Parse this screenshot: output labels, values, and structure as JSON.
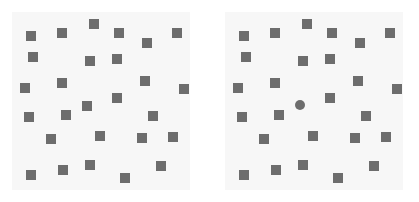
{
  "figure": {
    "name": "visual-search-stimulus",
    "width": 419,
    "height": 202,
    "page_background": "#ffffff",
    "panel_background": "#f7f7f7",
    "item_color": "#6d6d6d",
    "item_size_px": 10
  },
  "panels": [
    {
      "id": "panel-left",
      "label": "left-panel",
      "x": 12,
      "y": 12,
      "width": 178,
      "height": 178,
      "square_count": 27,
      "circle_count": 0,
      "has_target": false,
      "items": [
        {
          "shape": "square",
          "x": 31,
          "y": 36
        },
        {
          "shape": "square",
          "x": 62,
          "y": 33
        },
        {
          "shape": "square",
          "x": 94,
          "y": 24
        },
        {
          "shape": "square",
          "x": 119,
          "y": 33
        },
        {
          "shape": "square",
          "x": 147,
          "y": 43
        },
        {
          "shape": "square",
          "x": 177,
          "y": 33
        },
        {
          "shape": "square",
          "x": 33,
          "y": 57
        },
        {
          "shape": "square",
          "x": 90,
          "y": 61
        },
        {
          "shape": "square",
          "x": 117,
          "y": 59
        },
        {
          "shape": "square",
          "x": 25,
          "y": 88
        },
        {
          "shape": "square",
          "x": 62,
          "y": 83
        },
        {
          "shape": "square",
          "x": 145,
          "y": 81
        },
        {
          "shape": "square",
          "x": 184,
          "y": 89
        },
        {
          "shape": "square",
          "x": 117,
          "y": 98
        },
        {
          "shape": "square",
          "x": 87,
          "y": 106
        },
        {
          "shape": "square",
          "x": 29,
          "y": 117
        },
        {
          "shape": "square",
          "x": 66,
          "y": 115
        },
        {
          "shape": "square",
          "x": 153,
          "y": 116
        },
        {
          "shape": "square",
          "x": 51,
          "y": 139
        },
        {
          "shape": "square",
          "x": 100,
          "y": 136
        },
        {
          "shape": "square",
          "x": 142,
          "y": 138
        },
        {
          "shape": "square",
          "x": 173,
          "y": 137
        },
        {
          "shape": "square",
          "x": 63,
          "y": 170
        },
        {
          "shape": "square",
          "x": 90,
          "y": 165
        },
        {
          "shape": "square",
          "x": 125,
          "y": 178
        },
        {
          "shape": "square",
          "x": 161,
          "y": 166
        },
        {
          "shape": "square",
          "x": 31,
          "y": 175
        }
      ]
    },
    {
      "id": "panel-right",
      "label": "right-panel",
      "x": 225,
      "y": 12,
      "width": 178,
      "height": 178,
      "square_count": 26,
      "circle_count": 1,
      "has_target": true,
      "target_shape": "circle",
      "target_x": 300,
      "target_y": 105,
      "items": [
        {
          "shape": "square",
          "x": 244,
          "y": 36
        },
        {
          "shape": "square",
          "x": 275,
          "y": 33
        },
        {
          "shape": "square",
          "x": 307,
          "y": 24
        },
        {
          "shape": "square",
          "x": 332,
          "y": 33
        },
        {
          "shape": "square",
          "x": 360,
          "y": 43
        },
        {
          "shape": "square",
          "x": 390,
          "y": 33
        },
        {
          "shape": "square",
          "x": 246,
          "y": 57
        },
        {
          "shape": "square",
          "x": 303,
          "y": 61
        },
        {
          "shape": "square",
          "x": 330,
          "y": 59
        },
        {
          "shape": "square",
          "x": 238,
          "y": 88
        },
        {
          "shape": "square",
          "x": 275,
          "y": 83
        },
        {
          "shape": "square",
          "x": 358,
          "y": 81
        },
        {
          "shape": "square",
          "x": 397,
          "y": 89
        },
        {
          "shape": "square",
          "x": 330,
          "y": 98
        },
        {
          "shape": "circle",
          "x": 300,
          "y": 105
        },
        {
          "shape": "square",
          "x": 242,
          "y": 117
        },
        {
          "shape": "square",
          "x": 279,
          "y": 115
        },
        {
          "shape": "square",
          "x": 366,
          "y": 116
        },
        {
          "shape": "square",
          "x": 264,
          "y": 139
        },
        {
          "shape": "square",
          "x": 313,
          "y": 136
        },
        {
          "shape": "square",
          "x": 355,
          "y": 138
        },
        {
          "shape": "square",
          "x": 386,
          "y": 137
        },
        {
          "shape": "square",
          "x": 276,
          "y": 170
        },
        {
          "shape": "square",
          "x": 303,
          "y": 165
        },
        {
          "shape": "square",
          "x": 338,
          "y": 178
        },
        {
          "shape": "square",
          "x": 374,
          "y": 166
        },
        {
          "shape": "square",
          "x": 244,
          "y": 175
        }
      ]
    }
  ]
}
